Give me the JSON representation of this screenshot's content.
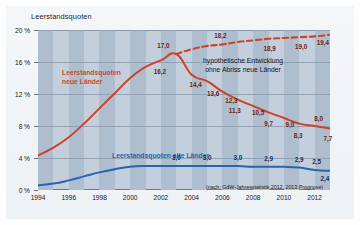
{
  "chart_data": {
    "type": "line",
    "title": "Leerstandsquoten",
    "xlabel": "",
    "ylabel": "",
    "ylim": [
      0,
      20
    ],
    "xlim": [
      1994,
      2013
    ],
    "grid": true,
    "legend_position": "inline-annotations",
    "y_ticks": [
      "0 %",
      "4 %",
      "8 %",
      "12 %",
      "16 %",
      "20 %"
    ],
    "y_tick_values": [
      0,
      4,
      8,
      12,
      16,
      20
    ],
    "x_ticks": [
      "1994",
      "1996",
      "1998",
      "2000",
      "2002",
      "2004",
      "2006",
      "2008",
      "2010",
      "2012"
    ],
    "x_tick_values": [
      1994,
      1996,
      1998,
      2000,
      2002,
      2004,
      2006,
      2008,
      2010,
      2012
    ],
    "source_note": "(nach: GdW-Jahresstatistik 2012, 2013 Prognose)",
    "annotation": "hypothetische Entwicklung\nohne Abriss neue Länder",
    "annotation_line1": "hypothetische Entwicklung",
    "annotation_line2": "ohne Abriss neue Länder",
    "colors": {
      "neue_laender": "#cf4226",
      "hypothetisch": "#cf4226",
      "alte_laender": "#2a63b0",
      "plot_background": "#c3cfdc",
      "plot_stripe": "#aebecf",
      "gridline": "#8d9eb0"
    },
    "series": [
      {
        "name": "Leerstandsquoten neue Länder",
        "label_line1": "Leerstandsquoten",
        "label_line2": "neue Länder",
        "style": "solid",
        "color": "#cf4226",
        "x": [
          1994,
          1995,
          1996,
          1997,
          1998,
          1999,
          2000,
          2001,
          2002,
          2003,
          2004,
          2005,
          2006,
          2007,
          2008,
          2009,
          2010,
          2011,
          2012,
          2013
        ],
        "values": [
          4.3,
          5.3,
          6.6,
          8.3,
          10.2,
          12.1,
          14.0,
          15.4,
          16.2,
          17.0,
          14.4,
          13.6,
          12.3,
          11.3,
          10.5,
          9.7,
          9.0,
          8.3,
          8.0,
          7.7
        ],
        "point_labels": [
          {
            "x": 2003,
            "value": "17,0"
          },
          {
            "x": 2002,
            "value": "16,2"
          },
          {
            "x": 2004,
            "value": "14,4"
          },
          {
            "x": 2005,
            "value": "13,6"
          },
          {
            "x": 2006,
            "value": "12,3"
          },
          {
            "x": 2007,
            "value": "11,3"
          },
          {
            "x": 2008,
            "value": "10,5"
          },
          {
            "x": 2009,
            "value": "9,7"
          },
          {
            "x": 2010,
            "value": "9,0"
          },
          {
            "x": 2011,
            "value": "8,3"
          },
          {
            "x": 2012,
            "value": "8,0"
          },
          {
            "x": 2013,
            "value": "7,7"
          }
        ]
      },
      {
        "name": "hypothetische Entwicklung ohne Abriss neue Länder",
        "style": "dashed",
        "color": "#cf4226",
        "x": [
          2003,
          2004,
          2005,
          2006,
          2007,
          2008,
          2009,
          2010,
          2011,
          2012,
          2013
        ],
        "values": [
          17.0,
          17.6,
          18.0,
          18.2,
          18.5,
          18.7,
          18.9,
          19.0,
          19.1,
          19.2,
          19.4
        ],
        "point_labels": [
          {
            "x": 2006,
            "value": "18,2"
          },
          {
            "x": 2009,
            "value": "18,9"
          },
          {
            "x": 2011,
            "value": "19,0"
          },
          {
            "x": 2013,
            "value": "19,4"
          }
        ]
      },
      {
        "name": "Leerstandsquoten alte Länder",
        "label": "Leerstandsquoten alte Länder",
        "style": "solid",
        "color": "#2a63b0",
        "x": [
          1994,
          1995,
          1996,
          1997,
          1998,
          1999,
          2000,
          2001,
          2002,
          2003,
          2004,
          2005,
          2006,
          2007,
          2008,
          2009,
          2010,
          2011,
          2012,
          2013
        ],
        "values": [
          0.6,
          0.8,
          1.2,
          1.7,
          2.2,
          2.6,
          2.9,
          3.0,
          3.0,
          3.0,
          3.0,
          3.0,
          3.0,
          3.0,
          2.9,
          2.9,
          2.9,
          2.8,
          2.5,
          2.4
        ],
        "point_labels": [
          {
            "x": 2003,
            "value": "3,0"
          },
          {
            "x": 2005,
            "value": "3,0"
          },
          {
            "x": 2007,
            "value": "3,0"
          },
          {
            "x": 2009,
            "value": "2,9"
          },
          {
            "x": 2011,
            "value": "2,9"
          },
          {
            "x": 2012,
            "value": "2,5"
          },
          {
            "x": 2013,
            "value": "2,4"
          }
        ]
      }
    ]
  }
}
